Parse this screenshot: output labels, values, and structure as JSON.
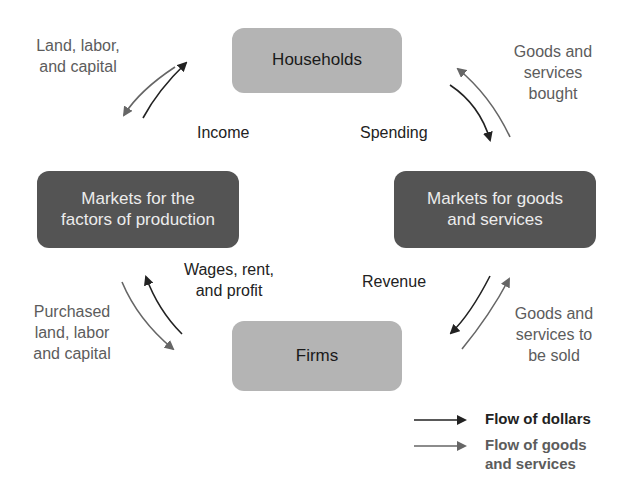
{
  "nodes": {
    "households": "Households",
    "firms": "Firms",
    "factor_markets": [
      "Markets for the",
      "factors of production"
    ],
    "goods_markets": [
      "Markets for goods",
      "and services"
    ]
  },
  "labels": {
    "land_labor_capital": [
      "Land, labor,",
      "and capital"
    ],
    "income": "Income",
    "spending": "Spending",
    "goods_services_bought": [
      "Goods and",
      "services",
      "bought"
    ],
    "wages_rent_profit": [
      "Wages, rent,",
      "and profit"
    ],
    "purchased_factors": [
      "Purchased",
      "land, labor",
      "and capital"
    ],
    "revenue": "Revenue",
    "goods_services_sold": [
      "Goods and",
      "services to",
      "be sold"
    ]
  },
  "legend": {
    "dollars": "Flow of dollars",
    "goods": [
      "Flow of goods",
      "and services"
    ]
  },
  "colors": {
    "dollars_arrow": "#222222",
    "goods_arrow": "#666666",
    "light_box": "#b4b4b4",
    "dark_box": "#545454"
  }
}
